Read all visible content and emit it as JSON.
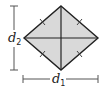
{
  "diagram": {
    "shape": "rhombus",
    "fill_color": "#d9d9d9",
    "stroke_color": "#222222",
    "dimension_line_color": "#555555",
    "vertices": {
      "top": [
        61,
        6
      ],
      "right": [
        98,
        38
      ],
      "bottom": [
        61,
        70
      ],
      "left": [
        24,
        38
      ]
    },
    "diagonals": [
      {
        "name": "d1",
        "orientation": "horizontal"
      },
      {
        "name": "d2",
        "orientation": "vertical"
      }
    ],
    "congruence_ticks_per_side": 1,
    "labels": {
      "d1": {
        "base": "d",
        "subscript": "1"
      },
      "d2": {
        "base": "d",
        "subscript": "2"
      }
    }
  }
}
